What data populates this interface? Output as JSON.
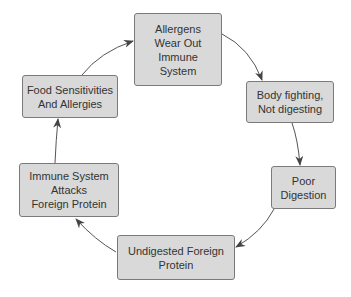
{
  "diagram": {
    "type": "cycle",
    "colors": {
      "node_fill": "#d9d9d9",
      "node_border": "#7a7a7a",
      "text": "#333333",
      "arrow": "#444444"
    },
    "nodes": [
      {
        "id": "allergens",
        "label": "Allergens\nWear Out\nImmune\nSystem"
      },
      {
        "id": "body-fighting",
        "label": "Body fighting,\nNot digesting"
      },
      {
        "id": "poor-digestion",
        "label": "Poor\nDigestion"
      },
      {
        "id": "undigested",
        "label": "Undigested Foreign\nProtein"
      },
      {
        "id": "immune-attacks",
        "label": "Immune System\nAttacks\nForeign Protein"
      },
      {
        "id": "food-sensitivities",
        "label": "Food Sensitivities\nAnd Allergies"
      }
    ],
    "edges": [
      {
        "from": "allergens",
        "to": "body-fighting"
      },
      {
        "from": "body-fighting",
        "to": "poor-digestion"
      },
      {
        "from": "poor-digestion",
        "to": "undigested"
      },
      {
        "from": "undigested",
        "to": "immune-attacks"
      },
      {
        "from": "immune-attacks",
        "to": "food-sensitivities"
      },
      {
        "from": "food-sensitivities",
        "to": "allergens"
      }
    ]
  }
}
